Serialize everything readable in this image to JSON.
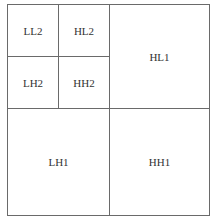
{
  "diagram": {
    "subbands": {
      "ll2": "LL2",
      "hl2": "HL2",
      "lh2": "LH2",
      "hh2": "HH2",
      "hl1": "HL1",
      "lh1": "LH1",
      "hh1": "HH1"
    }
  }
}
